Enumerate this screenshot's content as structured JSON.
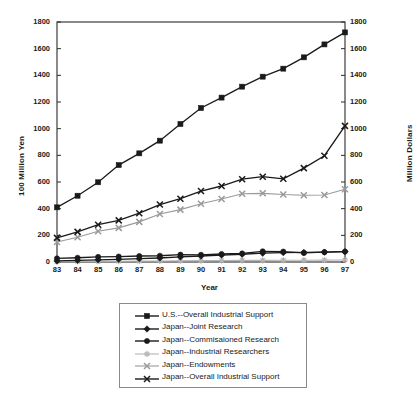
{
  "chart_data": {
    "type": "line",
    "title": "",
    "xlabel": "Year",
    "ylabel": "100 Million Yen",
    "y2label": "Million Dollars",
    "grid": false,
    "legend_position": "bottom",
    "ylim": [
      0,
      1800
    ],
    "y2lim": [
      0,
      1800
    ],
    "ytick_step": 200,
    "yticks": [
      0,
      200,
      400,
      600,
      800,
      1000,
      1200,
      1400,
      1600,
      1800
    ],
    "y2ticks": [
      0,
      200,
      400,
      600,
      800,
      1000,
      1200,
      1400,
      1600,
      1800
    ],
    "categories": [
      "83",
      "84",
      "85",
      "86",
      "87",
      "88",
      "89",
      "90",
      "91",
      "92",
      "93",
      "94",
      "95",
      "96",
      "97"
    ],
    "x": [
      83,
      84,
      85,
      86,
      87,
      88,
      89,
      90,
      91,
      92,
      93,
      94,
      95,
      96,
      97
    ],
    "series": [
      {
        "name": "U.S.--Overall Industrial Support",
        "axis": "right",
        "marker": "square",
        "color": "#1a1a1a",
        "values": [
          410,
          497,
          598,
          727,
          815,
          910,
          1035,
          1155,
          1233,
          1315,
          1390,
          1450,
          1535,
          1632,
          1722
        ]
      },
      {
        "name": "Japan--Joint Research",
        "axis": "left",
        "marker": "diamond",
        "color": "#1a1a1a",
        "values": [
          8,
          12,
          16,
          20,
          25,
          30,
          38,
          45,
          52,
          58,
          66,
          70,
          72,
          74,
          78
        ]
      },
      {
        "name": "Japan--Commissioned Research",
        "axis": "left",
        "marker": "circle",
        "color": "#1a1a1a",
        "values": [
          27,
          32,
          38,
          41,
          45,
          47,
          55,
          54,
          60,
          64,
          80,
          78,
          68,
          74,
          78
        ]
      },
      {
        "name": "Japan--Industrial Researchers",
        "axis": "left",
        "marker": "star",
        "color": "#b4b4b4",
        "values": [
          3,
          4,
          5,
          6,
          7,
          8,
          9,
          10,
          11,
          12,
          12,
          13,
          13,
          14,
          15
        ]
      },
      {
        "name": "Japan--Endowments",
        "axis": "left",
        "marker": "cross",
        "color": "#9a9a9a",
        "values": [
          150,
          186,
          231,
          256,
          301,
          360,
          393,
          437,
          472,
          512,
          515,
          506,
          501,
          503,
          545
        ]
      },
      {
        "name": "Japan--Overall Industrial Support",
        "axis": "left",
        "marker": "cross",
        "color": "#1a1a1a",
        "values": [
          181,
          226,
          280,
          312,
          366,
          431,
          475,
          532,
          570,
          621,
          640,
          624,
          704,
          797,
          1021
        ]
      }
    ]
  },
  "axes": {
    "left_title": "100 Million Yen",
    "right_title": "Million Dollars",
    "x_title": "Year"
  },
  "legend": {
    "entries": [
      {
        "label": "U.S.--Overall Industrial Support",
        "marker": "square",
        "color": "#1a1a1a"
      },
      {
        "label": "Japan--Joint Research",
        "marker": "diamond",
        "color": "#1a1a1a"
      },
      {
        "label": "Japan--Commisaioned Research",
        "marker": "circle",
        "color": "#1a1a1a"
      },
      {
        "label": "Japan--Industrial Researchers",
        "marker": "star",
        "color": "#b4b4b4"
      },
      {
        "label": "Japan--Endowments",
        "marker": "cross",
        "color": "#9a9a9a"
      },
      {
        "label": "Japan--Overall Industrial Support",
        "marker": "cross",
        "color": "#1a1a1a"
      }
    ]
  }
}
